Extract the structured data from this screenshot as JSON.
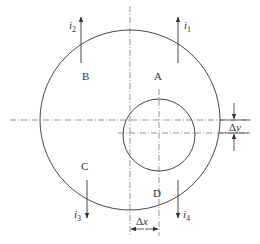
{
  "diagram": {
    "type": "eccentric-circle-current-diagram",
    "colors": {
      "line": "#333333",
      "centerline": "#555555",
      "background": "#ffffff"
    },
    "outer_circle": {
      "cx": 130,
      "cy": 120,
      "r": 90
    },
    "inner_circle": {
      "cx": 159,
      "cy": 135,
      "r": 36
    },
    "regions": [
      {
        "id": "A",
        "label": "A"
      },
      {
        "id": "B",
        "label": "B"
      },
      {
        "id": "C",
        "label": "C"
      },
      {
        "id": "D",
        "label": "D"
      }
    ],
    "currents": [
      {
        "id": "i1",
        "symbol": "i",
        "subscript": "1",
        "direction": "up"
      },
      {
        "id": "i2",
        "symbol": "i",
        "subscript": "2",
        "direction": "up"
      },
      {
        "id": "i3",
        "symbol": "i",
        "subscript": "3",
        "direction": "down"
      },
      {
        "id": "i4",
        "symbol": "i",
        "subscript": "4",
        "direction": "down"
      }
    ],
    "dimensions": {
      "dx": {
        "label_prefix": "Δ",
        "label_var": "x"
      },
      "dy": {
        "label_prefix": "Δ",
        "label_var": "y"
      }
    }
  }
}
